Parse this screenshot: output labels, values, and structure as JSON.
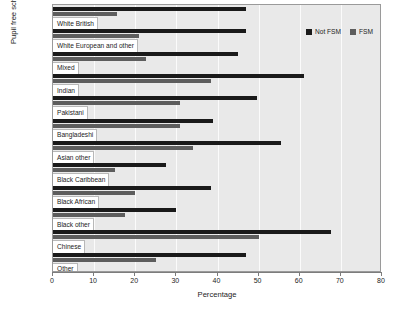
{
  "chart_data": {
    "type": "bar",
    "orientation": "horizontal",
    "title": "",
    "xlabel": "Percentage",
    "ylabel": "Pupil free school meal eligibility",
    "xlim": [
      0,
      80
    ],
    "xticks": [
      0,
      10,
      20,
      30,
      40,
      50,
      60,
      70,
      80
    ],
    "grid": true,
    "grid_axis": "x",
    "legend_position": "top-right",
    "categories": [
      "White British",
      "White European and other",
      "Mixed",
      "Indian",
      "Pakistani",
      "Bangladeshi",
      "Asian other",
      "Black Caribbean",
      "Black African",
      "Black other",
      "Chinese",
      "Other"
    ],
    "series": [
      {
        "name": "Not FSM",
        "color": "#1a1a1a",
        "values": [
          47,
          47,
          45,
          61,
          49.5,
          39,
          55.5,
          27.5,
          38.5,
          30,
          67.5,
          47
        ]
      },
      {
        "name": "FSM",
        "color": "#5d5d5d",
        "values": [
          15.5,
          21,
          22.5,
          38.5,
          31,
          31,
          34,
          15,
          20,
          17.5,
          50,
          25
        ]
      }
    ]
  },
  "legend": {
    "items": [
      {
        "label": "Not FSM",
        "swatch": "notfsm"
      },
      {
        "label": "FSM",
        "swatch": "fsm"
      }
    ]
  },
  "axis": {
    "x_title": "Percentage",
    "y_title": "Pupil free school meal eligibility",
    "x_tick_labels": [
      "0",
      "10",
      "20",
      "30",
      "40",
      "50",
      "60",
      "70",
      "80"
    ]
  }
}
